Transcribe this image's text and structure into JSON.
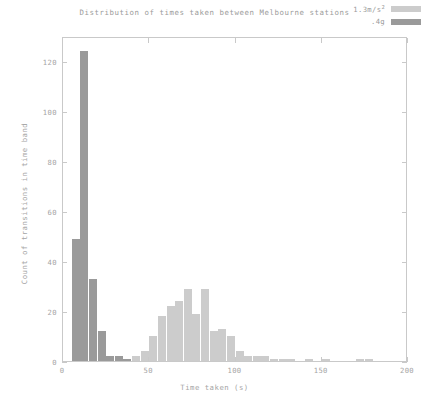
{
  "chart_data": {
    "type": "bar",
    "title": "Distribution of times taken between Melbourne stations",
    "xlabel": "Time taken (s)",
    "ylabel": "Count of transitions in time band",
    "xlim": [
      0,
      200
    ],
    "ylim": [
      0,
      130
    ],
    "xticks": [
      0,
      50,
      100,
      150,
      200
    ],
    "yticks": [
      0,
      20,
      40,
      60,
      80,
      100,
      120
    ],
    "grid": false,
    "legend_position": "top-right",
    "bin_width": 5,
    "series": [
      {
        "name": "1.3m/s²",
        "color": "#cccccc",
        "x": [
          5,
          10,
          15,
          20,
          25,
          30,
          35,
          40,
          45,
          50,
          55,
          60,
          65,
          70,
          75,
          80,
          85,
          90,
          95,
          100,
          105,
          110,
          115,
          120,
          125,
          130,
          135,
          140,
          145,
          150,
          155,
          160,
          165,
          170,
          175,
          180
        ],
        "values": [
          0,
          0,
          0,
          0,
          0,
          1,
          1,
          2,
          4,
          10,
          18,
          22,
          24,
          29,
          19,
          29,
          12,
          13,
          10,
          4,
          2,
          2,
          2,
          1,
          1,
          1,
          0,
          1,
          0,
          1,
          0,
          0,
          0,
          1,
          1,
          0
        ]
      },
      {
        "name": ".4g",
        "color": "#9a9a9a",
        "x": [
          5,
          10,
          15,
          20,
          25,
          30,
          35,
          40,
          45,
          50
        ],
        "values": [
          49,
          124,
          33,
          12,
          2,
          2,
          1,
          0,
          0,
          0
        ]
      }
    ],
    "legend": [
      {
        "label": "1.3m/s²",
        "color": "#cccccc"
      },
      {
        "label": ".4g",
        "color": "#9a9a9a"
      }
    ]
  }
}
